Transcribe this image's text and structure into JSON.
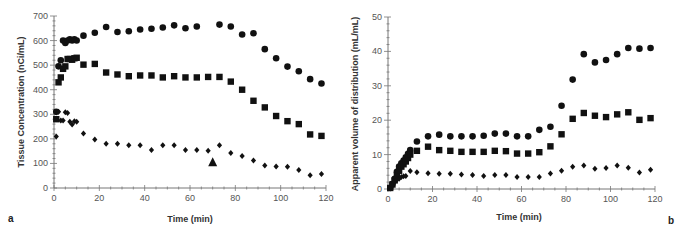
{
  "chart_data": [
    {
      "panel": "a",
      "type": "scatter",
      "title": "",
      "xlabel": "Time (min)",
      "ylabel": "Tissue Concentration (nCi/mL)",
      "xlim": [
        0,
        120
      ],
      "ylim": [
        0,
        700
      ],
      "xticks": [
        0,
        20,
        40,
        60,
        80,
        100,
        120
      ],
      "yticks": [
        0,
        100,
        200,
        300,
        400,
        500,
        600,
        700
      ],
      "grid": false,
      "legend": null,
      "series": [
        {
          "name": "circles",
          "marker": "circle",
          "x": [
            1,
            2,
            3,
            4,
            5,
            6,
            7,
            8,
            9,
            10,
            13,
            18,
            23,
            28,
            33,
            38,
            43,
            48,
            53,
            58,
            63,
            73,
            78,
            83,
            88,
            93,
            98,
            103,
            108,
            113,
            118
          ],
          "y": [
            310,
            495,
            520,
            600,
            590,
            600,
            605,
            600,
            605,
            600,
            620,
            632,
            655,
            635,
            638,
            645,
            648,
            653,
            662,
            650,
            657,
            665,
            657,
            625,
            630,
            565,
            528,
            494,
            475,
            443,
            425
          ]
        },
        {
          "name": "squares",
          "marker": "square",
          "x": [
            1,
            2,
            3,
            4,
            5,
            6,
            7,
            8,
            9,
            10,
            13,
            18,
            23,
            28,
            33,
            38,
            43,
            48,
            53,
            58,
            63,
            68,
            73,
            78,
            83,
            88,
            93,
            98,
            103,
            108,
            113,
            118
          ],
          "y": [
            280,
            430,
            450,
            485,
            495,
            525,
            525,
            522,
            528,
            530,
            502,
            505,
            470,
            462,
            455,
            458,
            458,
            450,
            455,
            450,
            450,
            452,
            452,
            433,
            400,
            355,
            328,
            293,
            272,
            260,
            218,
            212
          ],
          "note": "first few points overlap at early time"
        },
        {
          "name": "diamonds",
          "marker": "diamond",
          "x": [
            1,
            2,
            3,
            4,
            5,
            6,
            7,
            8,
            9,
            10,
            13,
            18,
            23,
            28,
            33,
            38,
            43,
            48,
            53,
            58,
            63,
            68,
            73,
            78,
            83,
            88,
            93,
            98,
            103,
            108,
            113,
            118
          ],
          "y": [
            210,
            310,
            275,
            275,
            308,
            305,
            270,
            258,
            272,
            270,
            222,
            197,
            180,
            180,
            174,
            174,
            155,
            174,
            174,
            155,
            155,
            152,
            174,
            142,
            130,
            112,
            92,
            87,
            86,
            73,
            52,
            57
          ]
        }
      ],
      "annotations": [
        {
          "type": "triangle-marker",
          "x": 70,
          "y": 105
        }
      ]
    },
    {
      "panel": "b",
      "type": "scatter",
      "title": "",
      "xlabel": "Time (min)",
      "ylabel": "Apparent volume of distribution (mL/mL)",
      "xlim": [
        0,
        120
      ],
      "ylim": [
        0,
        50
      ],
      "xticks": [
        0,
        20,
        40,
        60,
        80,
        100,
        120
      ],
      "yticks": [
        0,
        10,
        20,
        30,
        40,
        50
      ],
      "grid": false,
      "legend": null,
      "series": [
        {
          "name": "circles",
          "marker": "circle",
          "x": [
            1,
            2,
            3,
            4,
            5,
            6,
            7,
            8,
            9,
            10,
            13,
            18,
            23,
            28,
            33,
            38,
            43,
            48,
            53,
            58,
            63,
            68,
            73,
            78,
            83,
            88,
            93,
            98,
            103,
            108,
            113,
            118
          ],
          "y": [
            0.3,
            1.5,
            3,
            5,
            6.5,
            7.5,
            8.3,
            9.2,
            10.2,
            11.3,
            13.8,
            15.3,
            15.8,
            15.3,
            15.3,
            15.3,
            15.5,
            16.1,
            16.1,
            15.3,
            15.3,
            17.2,
            18.1,
            24.2,
            31.8,
            39.2,
            36.8,
            37.5,
            39.2,
            41,
            40.8,
            41
          ]
        },
        {
          "name": "squares",
          "marker": "square",
          "x": [
            1,
            2,
            3,
            4,
            5,
            6,
            7,
            8,
            9,
            10,
            13,
            18,
            23,
            28,
            33,
            38,
            43,
            48,
            53,
            58,
            63,
            68,
            73,
            78,
            83,
            88,
            93,
            98,
            103,
            108,
            113,
            118
          ],
          "y": [
            0.3,
            1.3,
            2.5,
            4,
            5.3,
            6.5,
            7.2,
            8,
            9,
            10,
            11.1,
            12.3,
            11.3,
            11.1,
            10.8,
            10.8,
            10.8,
            11.1,
            11,
            10.3,
            10.3,
            10.7,
            12.4,
            15.9,
            20.4,
            22.1,
            21.3,
            20.9,
            21.7,
            22.3,
            20.1,
            20.6
          ]
        },
        {
          "name": "diamonds",
          "marker": "diamond",
          "x": [
            1,
            2,
            3,
            4,
            5,
            6,
            7,
            8,
            10,
            13,
            18,
            23,
            28,
            33,
            38,
            43,
            48,
            53,
            58,
            63,
            68,
            73,
            78,
            83,
            88,
            93,
            98,
            103,
            108,
            113,
            118
          ],
          "y": [
            0.2,
            1,
            2,
            2.7,
            3,
            3.5,
            3.7,
            3.8,
            5.2,
            4.9,
            4.6,
            4.4,
            4.4,
            4.2,
            4.1,
            3.8,
            4.1,
            4.1,
            3.5,
            3.5,
            3.5,
            4.5,
            5.3,
            6.5,
            6.8,
            5.9,
            6.1,
            6.8,
            6.2,
            4.8,
            5.6
          ]
        }
      ],
      "annotations": []
    }
  ],
  "panels": {
    "a": {
      "label": "a",
      "xlabel": "Time (min)",
      "ylabel": "Tissue Concentration (nCi/mL)"
    },
    "b": {
      "label": "b",
      "xlabel": "Time (min)",
      "ylabel": "Apparent volume of distribution (mL/mL)"
    }
  },
  "colors": {
    "marker": "#111111",
    "axis": "#777777",
    "tick_text": "#555555",
    "label_text": "#333333"
  }
}
